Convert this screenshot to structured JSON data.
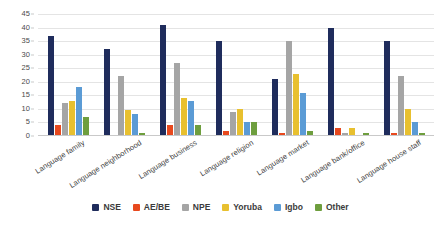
{
  "chart_data": {
    "type": "bar",
    "title": "",
    "xlabel": "",
    "ylabel": "",
    "ylim": [
      0,
      45
    ],
    "ytick_step": 5,
    "yticks": [
      "0",
      "5",
      "10",
      "15",
      "20",
      "25",
      "30",
      "35",
      "40",
      "45"
    ],
    "grid": true,
    "legend_position": "bottom",
    "categories": [
      "Language family",
      "Language neighborhood",
      "Language business",
      "Language religion",
      "Language market",
      "Language bank/office",
      "Language house staff"
    ],
    "series": [
      {
        "name": "NSE",
        "color": "#1F2C5C",
        "values": [
          37,
          32,
          41,
          35,
          21,
          40,
          35
        ]
      },
      {
        "name": "AE/BE",
        "color": "#E8491E",
        "values": [
          4,
          0,
          4,
          2,
          1,
          3,
          1
        ]
      },
      {
        "name": "NPE",
        "color": "#A5A5A5",
        "values": [
          12,
          22,
          27,
          9,
          35,
          1,
          22
        ]
      },
      {
        "name": "Yoruba",
        "color": "#E8C02F",
        "values": [
          13,
          9.5,
          14,
          10,
          23,
          3,
          10
        ]
      },
      {
        "name": "Igbo",
        "color": "#5B9BD5",
        "values": [
          18,
          8,
          13,
          5,
          16,
          0,
          5
        ]
      },
      {
        "name": "Other",
        "color": "#6E9E3E",
        "values": [
          7,
          1,
          4,
          5,
          2,
          1,
          1
        ]
      }
    ]
  }
}
